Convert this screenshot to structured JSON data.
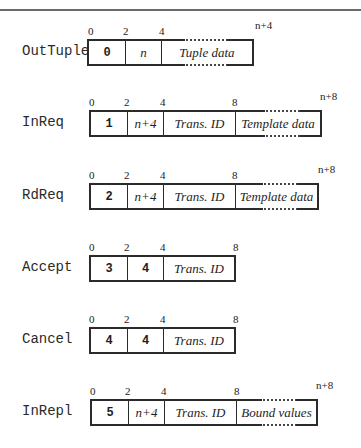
{
  "diagram": {
    "type": "message-format-diagram",
    "rows": [
      {
        "name": "OutTuple",
        "offsets": [
          "0",
          "2",
          "4",
          "n+4"
        ],
        "fields": [
          {
            "text": "0",
            "style": "code"
          },
          {
            "text": "n",
            "style": "italic"
          },
          {
            "text": "Tuple data",
            "style": "italic",
            "variable_length": true
          }
        ]
      },
      {
        "name": "InReq",
        "offsets": [
          "0",
          "2",
          "4",
          "8",
          "n+8"
        ],
        "fields": [
          {
            "text": "1",
            "style": "code"
          },
          {
            "text": "n+4",
            "style": "italic"
          },
          {
            "text": "Trans. ID",
            "style": "italic"
          },
          {
            "text": "Template data",
            "style": "italic",
            "variable_length": true
          }
        ]
      },
      {
        "name": "RdReq",
        "offsets": [
          "0",
          "2",
          "4",
          "8",
          "n+8"
        ],
        "fields": [
          {
            "text": "2",
            "style": "code"
          },
          {
            "text": "n+4",
            "style": "italic"
          },
          {
            "text": "Trans. ID",
            "style": "italic"
          },
          {
            "text": "Template data",
            "style": "italic",
            "variable_length": true
          }
        ]
      },
      {
        "name": "Accept",
        "offsets": [
          "0",
          "2",
          "4",
          "8"
        ],
        "fields": [
          {
            "text": "3",
            "style": "code"
          },
          {
            "text": "4",
            "style": "code"
          },
          {
            "text": "Trans. ID",
            "style": "italic"
          }
        ]
      },
      {
        "name": "Cancel",
        "offsets": [
          "0",
          "2",
          "4",
          "8"
        ],
        "fields": [
          {
            "text": "4",
            "style": "code"
          },
          {
            "text": "4",
            "style": "code"
          },
          {
            "text": "Trans. ID",
            "style": "italic"
          }
        ]
      },
      {
        "name": "InRepl",
        "offsets": [
          "0",
          "2",
          "4",
          "8",
          "n+8"
        ],
        "fields": [
          {
            "text": "5",
            "style": "code"
          },
          {
            "text": "n+4",
            "style": "italic"
          },
          {
            "text": "Trans. ID",
            "style": "italic"
          },
          {
            "text": "Bound values",
            "style": "italic",
            "variable_length": true
          }
        ]
      }
    ]
  }
}
